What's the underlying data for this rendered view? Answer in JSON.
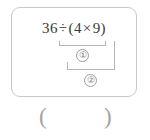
{
  "problem": {
    "expression": {
      "operand_1": "36",
      "operator_1": "÷",
      "paren_open": "(",
      "operand_2": "4",
      "operator_2": "×",
      "operand_3": "9",
      "paren_close": ")",
      "full_text": "36÷(4×9)"
    },
    "steps": [
      {
        "marker": "①",
        "covers": "(4×9)"
      },
      {
        "marker": "②",
        "covers": "36÷(4×9)"
      }
    ]
  },
  "answer": {
    "paren_open": "(",
    "paren_close": ")",
    "value": ""
  },
  "colors": {
    "card_border": "#c9c9c9",
    "text": "#3a3a3a",
    "annotation": "#b5b5b5",
    "marker_text": "#6e6e6e",
    "answer_paren": "#a2a2a2",
    "background": "#ffffff"
  }
}
